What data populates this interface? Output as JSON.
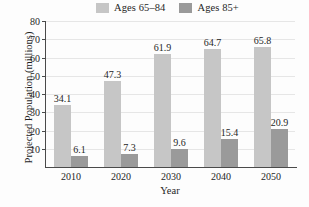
{
  "chart_data": {
    "type": "bar",
    "title": "",
    "xlabel": "Year",
    "ylabel": "Projected Population (millions)",
    "categories": [
      "2010",
      "2020",
      "2030",
      "2040",
      "2050"
    ],
    "series": [
      {
        "name": "Ages 65–84",
        "color": "#c6c6c6",
        "values": [
          34.1,
          47.3,
          61.9,
          64.7,
          65.8
        ]
      },
      {
        "name": "Ages 85+",
        "color": "#9a9a9a",
        "values": [
          6.1,
          7.3,
          9.6,
          15.4,
          20.9
        ]
      }
    ],
    "ylim": [
      0,
      80
    ],
    "yticks": [
      "10",
      "20",
      "30",
      "40",
      "50",
      "60",
      "70",
      "80"
    ],
    "ytick_values": [
      10,
      20,
      30,
      40,
      50,
      60,
      70,
      80
    ],
    "grid": "horizontal",
    "legend_position": "top",
    "data_labels": [
      [
        "34.1",
        "47.3",
        "61.9",
        "64.7",
        "65.8"
      ],
      [
        "6.1",
        "7.3",
        "9.6",
        "15.4",
        "20.9"
      ]
    ]
  },
  "legend": {
    "items": [
      {
        "label": "Ages 65–84",
        "color": "#c6c6c6"
      },
      {
        "label": "Ages 85+",
        "color": "#9a9a9a"
      }
    ]
  },
  "colors": {
    "light_bar": "#c6c6c6",
    "dark_bar": "#9a9a9a",
    "axis": "#4a4a4a",
    "grid": "#e6e6e6",
    "text": "#1f1f1f",
    "background": "#fdfdfd"
  }
}
